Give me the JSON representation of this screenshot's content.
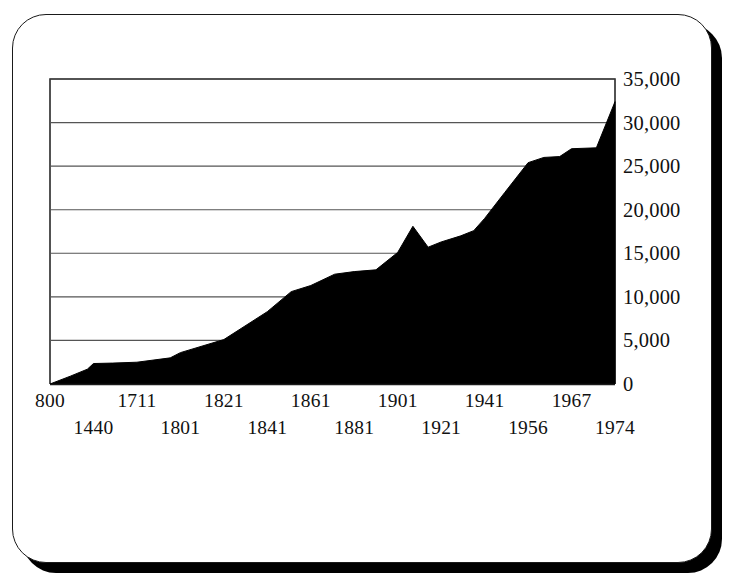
{
  "card": {
    "name": "chart-card"
  },
  "chart_data": {
    "type": "area",
    "title": "",
    "subtitle": "",
    "xlabel": "",
    "ylabel": "",
    "grid": true,
    "legend": false,
    "legend_position": "none",
    "fill_color": "#000000",
    "line_color": "#000000",
    "grid_color": "#555555",
    "axis_color": "#1a1a1a",
    "background_color": "#ffffff",
    "ylim": [
      0,
      35000
    ],
    "ytick_labels": [
      "35,000",
      "30,000",
      "25,000",
      "20,000",
      "15,000",
      "10,000",
      "5,000",
      "0"
    ],
    "ytick_values": [
      35000,
      30000,
      25000,
      20000,
      15000,
      10000,
      5000,
      0
    ],
    "xtick_labels_top": [
      "800",
      "1711",
      "1821",
      "1861",
      "1901",
      "1941",
      "1967"
    ],
    "xtick_labels_bottom": [
      "1440",
      "1801",
      "1841",
      "1881",
      "1921",
      "1956",
      "1974"
    ],
    "xtick_labels": [
      "800",
      "1440",
      "1711",
      "1801",
      "1821",
      "1841",
      "1861",
      "1881",
      "1901",
      "1921",
      "1941",
      "1956",
      "1967",
      "1974"
    ],
    "categories": [
      "800",
      "1440",
      "1711",
      "1801",
      "1821",
      "1841",
      "1861",
      "1881",
      "1901",
      "1921",
      "1941",
      "1956",
      "1967",
      "1974"
    ],
    "values": [
      0,
      1500,
      2400,
      3400,
      5300,
      8200,
      11300,
      12800,
      14900,
      16000,
      18900,
      25300,
      27000,
      32400
    ],
    "points": [
      {
        "x": 800,
        "y": 0
      },
      {
        "x": 1100,
        "y": 900
      },
      {
        "x": 1350,
        "y": 1700
      },
      {
        "x": 1440,
        "y": 2350
      },
      {
        "x": 1560,
        "y": 2400
      },
      {
        "x": 1711,
        "y": 2500
      },
      {
        "x": 1780,
        "y": 3000
      },
      {
        "x": 1801,
        "y": 3600
      },
      {
        "x": 1821,
        "y": 5100
      },
      {
        "x": 1841,
        "y": 8300
      },
      {
        "x": 1852,
        "y": 10600
      },
      {
        "x": 1861,
        "y": 11300
      },
      {
        "x": 1872,
        "y": 12600
      },
      {
        "x": 1881,
        "y": 12900
      },
      {
        "x": 1891,
        "y": 13100
      },
      {
        "x": 1901,
        "y": 15100
      },
      {
        "x": 1908,
        "y": 18100
      },
      {
        "x": 1915,
        "y": 15700
      },
      {
        "x": 1921,
        "y": 16300
      },
      {
        "x": 1930,
        "y": 17000
      },
      {
        "x": 1936,
        "y": 17600
      },
      {
        "x": 1941,
        "y": 19000
      },
      {
        "x": 1948,
        "y": 22000
      },
      {
        "x": 1956,
        "y": 25400
      },
      {
        "x": 1960,
        "y": 26000
      },
      {
        "x": 1964,
        "y": 26100
      },
      {
        "x": 1967,
        "y": 27000
      },
      {
        "x": 1971,
        "y": 27100
      },
      {
        "x": 1974,
        "y": 32400
      }
    ]
  }
}
